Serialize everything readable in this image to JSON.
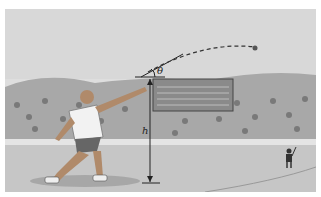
{
  "figure": {
    "labels": {
      "angle": "θ",
      "height": "h"
    },
    "colors": {
      "sky": "#dcdcdc",
      "crowd": "#9a9a9a",
      "ground": "#c4c4c4",
      "lines": "#222222"
    }
  }
}
